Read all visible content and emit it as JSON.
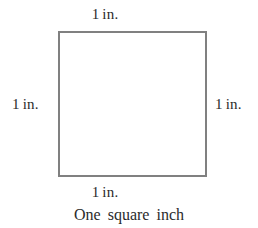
{
  "figure": {
    "caption": "One square inch",
    "shape": {
      "name": "square",
      "fill_color": "#ffffff",
      "stroke_color": "#808080",
      "stroke_width_px": 2
    },
    "background_color": "#ffffff",
    "text_color": "#2b2b2b",
    "labels": {
      "top": {
        "value": "1",
        "unit": "in."
      },
      "bottom": {
        "value": "1",
        "unit": "in."
      },
      "left": {
        "value": "1",
        "unit": "in."
      },
      "right": {
        "value": "1",
        "unit": "in."
      }
    }
  }
}
